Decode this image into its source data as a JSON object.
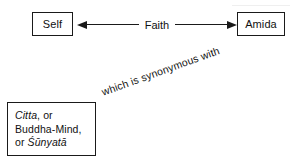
{
  "diagram": {
    "title_text": "",
    "nodes": [
      {
        "id": "self",
        "label": "Self"
      },
      {
        "id": "amida",
        "label": "Amida"
      }
    ],
    "concept_box": {
      "lines": [
        {
          "italic_part": "Citta",
          "plain_part": ", or"
        },
        {
          "italic_part": "",
          "plain_part": "Buddha-Mind,"
        },
        {
          "italic_part": "Śūnyatā",
          "plain_part": "or "
        }
      ],
      "line1_italic": "Citta",
      "line1_plain": ", or",
      "line2_plain": "Buddha-Mind,",
      "line3_plain": "or ",
      "line3_italic": "Śūnyatā"
    },
    "edges": [
      {
        "id": "faith",
        "label": "Faith",
        "from": "self",
        "to": "amida",
        "style": "double-headed-arrow"
      },
      {
        "id": "synonym",
        "label": "which is synonymous with",
        "from": "concept-box",
        "to": "amida",
        "style": "rotated-text"
      }
    ],
    "colors": {
      "ink": "#111111",
      "stroke": "#1a1a1a",
      "background": "#ffffff"
    }
  }
}
